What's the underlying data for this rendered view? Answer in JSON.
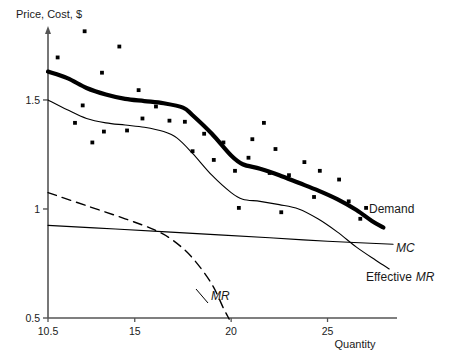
{
  "chart_data": {
    "type": "line",
    "title": "",
    "xlabel": "Quantity",
    "ylabel": "Price, Cost, $",
    "xlim": [
      10.5,
      28.5
    ],
    "ylim": [
      0.5,
      1.83
    ],
    "grid": false,
    "legend_position": "inline-right-of-curve-ends",
    "xticks": [
      10.5,
      15,
      20,
      25
    ],
    "xtick_labels": [
      "10.5",
      "15",
      "20",
      "25"
    ],
    "yticks": [
      0.5,
      1,
      1.5
    ],
    "ytick_labels": [
      "0.5",
      "1",
      "1.5"
    ],
    "series": [
      {
        "name": "Demand",
        "style": "thick-solid",
        "label": "Demand",
        "color": "#000000",
        "points": [
          [
            10.5,
            1.63
          ],
          [
            11.5,
            1.6
          ],
          [
            12.5,
            1.555
          ],
          [
            13.5,
            1.525
          ],
          [
            14.5,
            1.505
          ],
          [
            15.5,
            1.495
          ],
          [
            16.5,
            1.485
          ],
          [
            17.5,
            1.465
          ],
          [
            18.0,
            1.43
          ],
          [
            19.0,
            1.345
          ],
          [
            20.0,
            1.245
          ],
          [
            20.6,
            1.205
          ],
          [
            21.5,
            1.185
          ],
          [
            22.5,
            1.155
          ],
          [
            23.5,
            1.12
          ],
          [
            24.5,
            1.085
          ],
          [
            25.5,
            1.045
          ],
          [
            26.5,
            0.995
          ],
          [
            27.3,
            0.945
          ],
          [
            27.9,
            0.915
          ]
        ]
      },
      {
        "name": "Effective MR",
        "style": "thin-solid",
        "label": "Effective MR",
        "color": "#000000",
        "points": [
          [
            10.5,
            1.5
          ],
          [
            11.5,
            1.455
          ],
          [
            12.5,
            1.415
          ],
          [
            13.5,
            1.395
          ],
          [
            14.5,
            1.385
          ],
          [
            15.5,
            1.375
          ],
          [
            16.5,
            1.355
          ],
          [
            17.2,
            1.325
          ],
          [
            18.0,
            1.255
          ],
          [
            19.0,
            1.155
          ],
          [
            20.0,
            1.075
          ],
          [
            20.6,
            1.045
          ],
          [
            21.5,
            1.035
          ],
          [
            22.5,
            1.02
          ],
          [
            23.5,
            1.0
          ],
          [
            24.5,
            0.955
          ],
          [
            25.5,
            0.895
          ],
          [
            26.5,
            0.825
          ],
          [
            27.5,
            0.765
          ],
          [
            28.2,
            0.725
          ]
        ]
      },
      {
        "name": "MC",
        "style": "thin-solid",
        "label": "MC",
        "color": "#000000",
        "points": [
          [
            10.5,
            0.925
          ],
          [
            14.0,
            0.908
          ],
          [
            18.0,
            0.888
          ],
          [
            22.0,
            0.868
          ],
          [
            25.0,
            0.852
          ],
          [
            28.4,
            0.838
          ]
        ]
      },
      {
        "name": "MR",
        "style": "dashed",
        "label": "MR",
        "color": "#000000",
        "points": [
          [
            10.5,
            1.075
          ],
          [
            12.5,
            1.015
          ],
          [
            14.5,
            0.955
          ],
          [
            16.0,
            0.905
          ],
          [
            17.0,
            0.855
          ],
          [
            18.0,
            0.775
          ],
          [
            19.0,
            0.655
          ],
          [
            19.6,
            0.545
          ],
          [
            19.9,
            0.495
          ]
        ]
      }
    ],
    "scatter": {
      "name": "observations",
      "marker": "square",
      "color": "#000000",
      "points": [
        [
          12.4,
          1.815
        ],
        [
          11.0,
          1.695
        ],
        [
          14.2,
          1.745
        ],
        [
          13.3,
          1.625
        ],
        [
          12.3,
          1.475
        ],
        [
          15.2,
          1.545
        ],
        [
          11.9,
          1.395
        ],
        [
          13.4,
          1.355
        ],
        [
          14.6,
          1.36
        ],
        [
          12.8,
          1.305
        ],
        [
          16.1,
          1.47
        ],
        [
          15.4,
          1.415
        ],
        [
          16.8,
          1.405
        ],
        [
          17.6,
          1.4
        ],
        [
          18.6,
          1.345
        ],
        [
          18.0,
          1.265
        ],
        [
          19.6,
          1.305
        ],
        [
          19.1,
          1.225
        ],
        [
          20.9,
          1.235
        ],
        [
          20.2,
          1.175
        ],
        [
          21.7,
          1.395
        ],
        [
          21.1,
          1.32
        ],
        [
          22.3,
          1.275
        ],
        [
          22.0,
          1.165
        ],
        [
          23.0,
          1.155
        ],
        [
          23.8,
          1.215
        ],
        [
          24.6,
          1.175
        ],
        [
          25.6,
          1.135
        ],
        [
          24.3,
          1.055
        ],
        [
          26.1,
          1.035
        ],
        [
          27.0,
          1.005
        ],
        [
          20.4,
          1.005
        ],
        [
          22.6,
          0.985
        ],
        [
          26.7,
          0.955
        ]
      ]
    }
  },
  "labels": {
    "y_axis_title": "Price, Cost, $",
    "x_axis_title": "Quantity",
    "demand": "Demand",
    "mc": "MC",
    "effective_mr_prefix": "Effective",
    "effective_mr_ital": "MR",
    "mr": "MR"
  }
}
